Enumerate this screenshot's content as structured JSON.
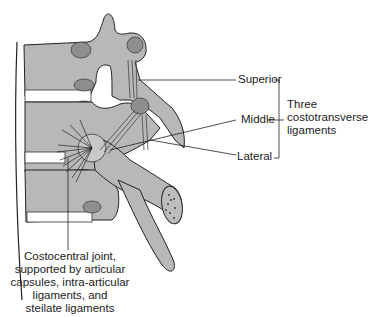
{
  "figure": {
    "labels": {
      "superior": "Superior",
      "middle": "Middle",
      "lateral": "Lateral",
      "group_line1": "Three",
      "group_line2": "costotransverse",
      "group_line3": "ligaments",
      "joint_line1": "Costocentral joint,",
      "joint_line2": "supported by articular",
      "joint_line3": "capsules, intra-articular",
      "joint_line4": "ligaments, and",
      "joint_line5": "steilate ligaments"
    },
    "colors": {
      "bone": "#b8b8b8",
      "bone_dark": "#8e8e8e",
      "ligament": "#ffffff",
      "outline": "#222222"
    }
  }
}
